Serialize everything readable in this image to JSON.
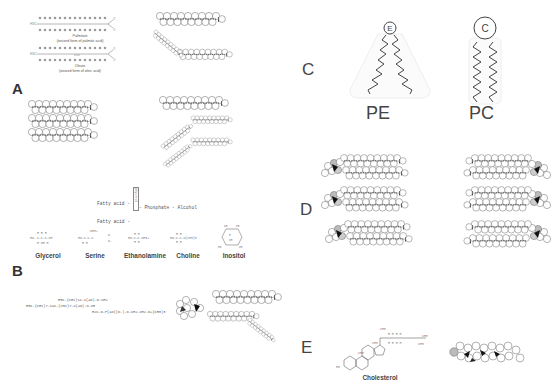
{
  "panels": {
    "A": {
      "letter": "A",
      "palmitate": {
        "name": "Palmitate",
        "caption": "(ionized form of palmitic acid)"
      },
      "oleate": {
        "name": "Oleate",
        "caption": "(ionized form of oleic acid)"
      }
    },
    "B": {
      "letter": "B",
      "scheme": {
        "fatty_acid_1": "Fatty acid -",
        "fatty_acid_2": "Fatty acid -",
        "backbone": "Glycerol",
        "tail": "- Phosphate - Alcohol"
      },
      "alcohols": [
        {
          "name": "Glycerol",
          "formula": "HO-CH2-CH(OH)-CH2-OH"
        },
        {
          "name": "Serine",
          "formula": "HO-CH2-CH(NH3+)-COO-"
        },
        {
          "name": "Ethanolamine",
          "formula": "HO-CH2-CH2-NH3+"
        },
        {
          "name": "Choline",
          "formula": "HO-CH2-CH2-N+(CH3)3"
        },
        {
          "name": "Inositol",
          "formula": "C6H6(OH)6"
        }
      ],
      "pc_formula": {
        "line1": "H3C-(CH2)14-C(=O)-O-CH2",
        "line2": "H3C-(CH2)7-C=C-(CH2)7-C(=O)-O-CH",
        "line3": "H2C-O-P(=O)(O-)-O-CH2-CH2-N+(CH3)3"
      }
    },
    "C": {
      "letter": "C",
      "pe": {
        "label": "PE",
        "head": "E"
      },
      "pc": {
        "label": "PC",
        "head": "C"
      }
    },
    "D": {
      "letter": "D"
    },
    "E": {
      "letter": "E",
      "cholesterol": {
        "name": "Cholesterol"
      }
    }
  }
}
